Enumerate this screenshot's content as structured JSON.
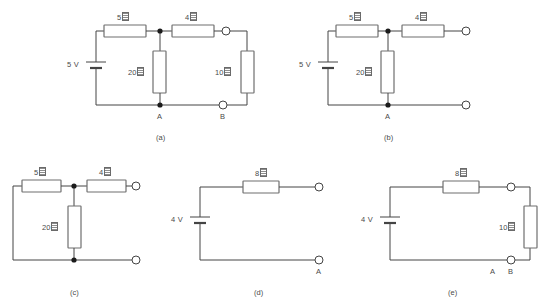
{
  "figure": {
    "kind": "circuit-diagram-set",
    "ohm_symbol_note": "missing-glyph-box",
    "subfigures": [
      {
        "id": "a",
        "caption": "(a)",
        "source_label": "5 V",
        "resistors": [
          {
            "value": "5",
            "unit": "ohm",
            "orientation": "horizontal",
            "name": "r5"
          },
          {
            "value": "4",
            "unit": "ohm",
            "orientation": "horizontal",
            "name": "r4"
          },
          {
            "value": "20",
            "unit": "ohm",
            "orientation": "vertical",
            "name": "r20"
          },
          {
            "value": "10",
            "unit": "ohm",
            "orientation": "vertical",
            "name": "r10"
          }
        ],
        "terminals": [
          "A",
          "B"
        ]
      },
      {
        "id": "b",
        "caption": "(b)",
        "source_label": "5 V",
        "resistors": [
          {
            "value": "5",
            "unit": "ohm",
            "orientation": "horizontal",
            "name": "r5"
          },
          {
            "value": "4",
            "unit": "ohm",
            "orientation": "horizontal",
            "name": "r4"
          },
          {
            "value": "20",
            "unit": "ohm",
            "orientation": "vertical",
            "name": "r20"
          }
        ],
        "terminals": [
          "A"
        ]
      },
      {
        "id": "c",
        "caption": "(c)",
        "source_label": "",
        "resistors": [
          {
            "value": "5",
            "unit": "ohm",
            "orientation": "horizontal",
            "name": "r5"
          },
          {
            "value": "4",
            "unit": "ohm",
            "orientation": "horizontal",
            "name": "r4"
          },
          {
            "value": "20",
            "unit": "ohm",
            "orientation": "vertical",
            "name": "r20"
          }
        ],
        "terminals": []
      },
      {
        "id": "d",
        "caption": "(d)",
        "source_label": "4 V",
        "resistors": [
          {
            "value": "8",
            "unit": "ohm",
            "orientation": "horizontal",
            "name": "r8"
          }
        ],
        "terminals": [
          "A"
        ]
      },
      {
        "id": "e",
        "caption": "(e)",
        "source_label": "4 V",
        "resistors": [
          {
            "value": "8",
            "unit": "ohm",
            "orientation": "horizontal",
            "name": "r8"
          },
          {
            "value": "10",
            "unit": "ohm",
            "orientation": "vertical",
            "name": "r10"
          }
        ],
        "terminals": [
          "A",
          "B"
        ]
      }
    ]
  },
  "labels": {
    "a": {
      "source": "5 V",
      "r5_num": "5",
      "r4_num": "4",
      "r20_num": "20",
      "r10_num": "10",
      "node_a": "A",
      "node_b": "B",
      "caption": "(a)"
    },
    "b": {
      "source": "5 V",
      "r5_num": "5",
      "r4_num": "4",
      "r20_num": "20",
      "node_a": "A",
      "caption": "(b)"
    },
    "c": {
      "r5_num": "5",
      "r4_num": "4",
      "r20_num": "20",
      "caption": "(c)"
    },
    "d": {
      "source": "4 V",
      "r8_num": "8",
      "node_a": "A",
      "caption": "(d)"
    },
    "e": {
      "source": "4 V",
      "r8_num": "8",
      "r10_num": "10",
      "node_a": "A",
      "node_b": "B",
      "caption": "(e)"
    }
  },
  "colors": {
    "wire": "#444444",
    "resistor_border": "#6f6f6f",
    "resistor_fill": "#ffffff",
    "text": "#4a4a4a",
    "junction": "#1b1b1b",
    "background": "#ffffff"
  }
}
